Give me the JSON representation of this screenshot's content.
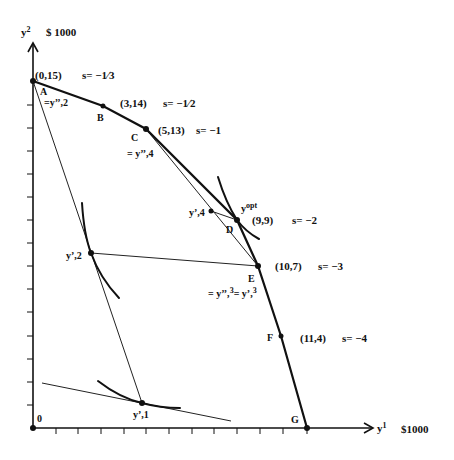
{
  "axes": {
    "y_axis_label": "y",
    "y_axis_sup": "2",
    "y_axis_unit": "$ 1000",
    "x_axis_label": "y",
    "x_axis_sup": "1",
    "x_axis_unit": "$1000",
    "origin_label": "0",
    "x_ticks": 12,
    "y_ticks": 15
  },
  "frontier_points": [
    {
      "id": "A",
      "coord": "(0,15)",
      "slope": "s= −1⤸3",
      "x": 0,
      "y": 15
    },
    {
      "id": "B",
      "coord": "(3,14)",
      "slope": "s= −1⤸2",
      "x": 3,
      "y": 14
    },
    {
      "id": "C",
      "coord": "(5,13)",
      "slope": "s= −1",
      "x": 5,
      "y": 13
    },
    {
      "id": "D",
      "coord": "(9,9)",
      "slope": "s= −2",
      "x": 9,
      "y": 9
    },
    {
      "id": "E",
      "coord": "(10,7)",
      "slope": "s= −3",
      "x": 10,
      "y": 7
    },
    {
      "id": "F",
      "coord": "(11,4)",
      "slope": "s= −4",
      "x": 11,
      "y": 4
    },
    {
      "id": "G",
      "coord": "",
      "slope": "",
      "x": 12,
      "y": 0
    }
  ],
  "labels": {
    "A": "A",
    "B": "B",
    "C": "C",
    "D": "D",
    "E": "E",
    "F": "F",
    "G": "G",
    "a_eq": "=y’’,2",
    "c_eq": "= y’’,4",
    "e_eq_1": "= y’’,",
    "e_eq_1_sup": "3",
    "e_eq_2": "= y’,",
    "e_eq_2_sup": "3",
    "y1_label": "y’,1",
    "y2_label": "y’,2",
    "y4_label": "y’,4",
    "yopt_base": "y",
    "yopt_sup": "opt",
    "coord_A": "(0,15)",
    "slope_A": "s= −1∕3",
    "coord_B": "(3,14)",
    "slope_B": "s= −1∕2",
    "coord_C": "(5,13)",
    "slope_C": "s= −1",
    "coord_D": "(9,9)",
    "slope_D": "s= −2",
    "coord_E": "(10,7)",
    "slope_E": "s= −3",
    "coord_F": "(11,4)",
    "slope_F": "s= −4"
  },
  "iterates": [
    {
      "name": "y'1",
      "x": 4.8,
      "y": 1.1
    },
    {
      "name": "y'2",
      "x": 2.6,
      "y": 7.6
    },
    {
      "name": "y'3",
      "x": 10,
      "y": 7
    },
    {
      "name": "y'4",
      "x": 7.8,
      "y": 9.4
    },
    {
      "name": "y_opt",
      "x": 9,
      "y": 9
    }
  ],
  "colors": {
    "ink": "#111111",
    "background": "#ffffff"
  }
}
